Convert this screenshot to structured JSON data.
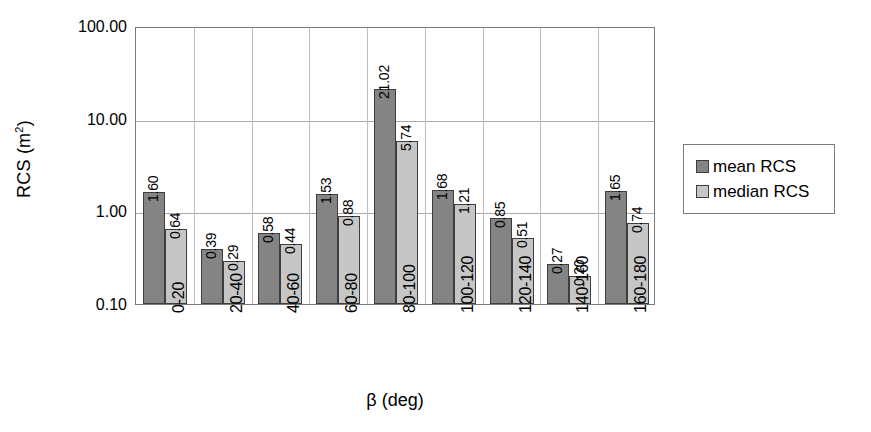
{
  "chart_data": {
    "type": "bar",
    "title": "",
    "xlabel": "β (deg)",
    "ylabel": "RCS (m²)",
    "ylabel_base": "RCS (m",
    "ylabel_sup": "2",
    "ylabel_close": ")",
    "yscale": "log",
    "ylim": [
      0.1,
      100.0
    ],
    "ytick_labels": [
      "100.00",
      "10.00",
      "1.00",
      "0.10"
    ],
    "ytick_values": [
      100.0,
      10.0,
      1.0,
      0.1
    ],
    "grid": true,
    "legend_position": "right",
    "categories": [
      "0-20",
      "20-40",
      "40-60",
      "60-80",
      "80-100",
      "100-120",
      "120-140",
      "140-160",
      "160-180"
    ],
    "series": [
      {
        "name": "mean RCS",
        "color": "#848484",
        "values": [
          1.6,
          0.39,
          0.58,
          1.53,
          21.02,
          1.68,
          0.85,
          0.27,
          1.65
        ],
        "labels": [
          "1.60",
          "0.39",
          "0.58",
          "1.53",
          "21.02",
          "1.68",
          "0.85",
          "0.27",
          "1.65"
        ]
      },
      {
        "name": "median RCS",
        "color": "#c6c6c6",
        "values": [
          0.64,
          0.29,
          0.44,
          0.88,
          5.74,
          1.21,
          0.51,
          0.2,
          0.74
        ],
        "labels": [
          "0.64",
          "0.29",
          "0.44",
          "0.88",
          "5.74",
          "1.21",
          "0.51",
          "0.20",
          "0.74"
        ]
      }
    ]
  },
  "legend": {
    "items": [
      {
        "label": "mean RCS",
        "swatch": "mean"
      },
      {
        "label": "median RCS",
        "swatch": "median"
      }
    ]
  }
}
